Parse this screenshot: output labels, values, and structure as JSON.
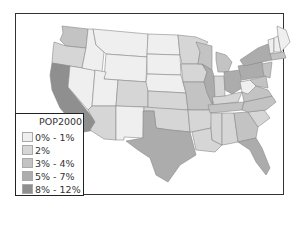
{
  "map": {
    "layer_name": "POP2000 as",
    "legend": [
      {
        "label": "0% - 1%",
        "color": "#efefef"
      },
      {
        "label": "2%",
        "color": "#d6d6d6"
      },
      {
        "label": "3% - 4%",
        "color": "#c3c3c3"
      },
      {
        "label": "5% - 7%",
        "color": "#acacac"
      },
      {
        "label": "8% - 12%",
        "color": "#8f8f8f"
      }
    ],
    "states": {
      "WA": "#c3c3c3",
      "OR": "#d6d6d6",
      "CA": "#8f8f8f",
      "NV": "#efefef",
      "ID": "#efefef",
      "MT": "#efefef",
      "WY": "#efefef",
      "UT": "#efefef",
      "AZ": "#d6d6d6",
      "CO": "#d6d6d6",
      "NM": "#efefef",
      "ND": "#efefef",
      "SD": "#efefef",
      "NE": "#efefef",
      "KS": "#d6d6d6",
      "OK": "#d6d6d6",
      "TX": "#acacac",
      "MN": "#d6d6d6",
      "IA": "#d6d6d6",
      "MO": "#c3c3c3",
      "AR": "#d6d6d6",
      "LA": "#d6d6d6",
      "WI": "#c3c3c3",
      "IL": "#acacac",
      "MI": "#c3c3c3",
      "IN": "#d6d6d6",
      "OH": "#acacac",
      "KY": "#d6d6d6",
      "TN": "#c3c3c3",
      "MS": "#d6d6d6",
      "AL": "#d6d6d6",
      "GA": "#c3c3c3",
      "FL": "#acacac",
      "SC": "#d6d6d6",
      "NC": "#c3c3c3",
      "VA": "#c3c3c3",
      "WV": "#efefef",
      "PA": "#acacac",
      "NY": "#acacac",
      "VT": "#efefef",
      "NH": "#efefef",
      "ME": "#efefef",
      "MA": "#c3c3c3",
      "NJ": "#c3c3c3",
      "MD": "#c3c3c3"
    }
  }
}
